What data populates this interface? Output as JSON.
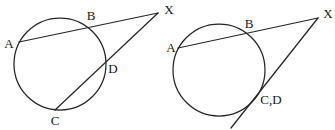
{
  "canvas": {
    "width": 335,
    "height": 130,
    "background": "#ffffff",
    "stroke_color": "#252525",
    "stroke_width": 1.25,
    "label_color": "#161616"
  },
  "figures": [
    {
      "name": "left",
      "description": "circle with two secants from external point X",
      "circle": {
        "cx": 60,
        "cy": 64,
        "r": 46
      },
      "lines": [
        {
          "name": "secant-A-B-X",
          "x1": 19,
          "y1": 42,
          "x2": 158,
          "y2": 13
        },
        {
          "name": "secant-C-D-X",
          "x1": 55,
          "y1": 110,
          "x2": 158,
          "y2": 13
        }
      ],
      "labels": [
        {
          "text": "A",
          "x": 9,
          "y": 43
        },
        {
          "text": "B",
          "x": 91,
          "y": 15
        },
        {
          "text": "C",
          "x": 55,
          "y": 120
        },
        {
          "text": "D",
          "x": 113,
          "y": 68
        },
        {
          "text": "X",
          "x": 169,
          "y": 9
        }
      ]
    },
    {
      "name": "right",
      "description": "circle with secant and tangent from external point X",
      "circle": {
        "cx": 219,
        "cy": 70,
        "r": 46
      },
      "lines": [
        {
          "name": "secant-A-B-X",
          "x1": 178,
          "y1": 48,
          "x2": 318,
          "y2": 18
        },
        {
          "name": "tangent-CD-X",
          "x1": 231,
          "y1": 128,
          "x2": 318,
          "y2": 18
        }
      ],
      "labels": [
        {
          "text": "A",
          "x": 171,
          "y": 47
        },
        {
          "text": "B",
          "x": 249,
          "y": 23
        },
        {
          "text": "C,D",
          "x": 271,
          "y": 99
        },
        {
          "text": "X",
          "x": 328,
          "y": 13
        }
      ]
    }
  ]
}
